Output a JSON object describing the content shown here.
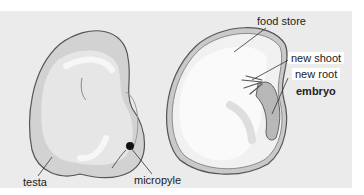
{
  "diagram": {
    "type": "labelled-biology-diagram",
    "colors": {
      "panel_bg": "#ebebeb",
      "seed_fill": "#d4d4d4",
      "seed_highlight": "#f2f2f2",
      "outline": "#555555",
      "micropyle": "#111111"
    },
    "labels": {
      "testa": "testa",
      "micropyle": "micropyle",
      "food_store": "food store",
      "new_shoot": "new shoot",
      "new_root": "new root",
      "embryo": "embryo"
    }
  }
}
